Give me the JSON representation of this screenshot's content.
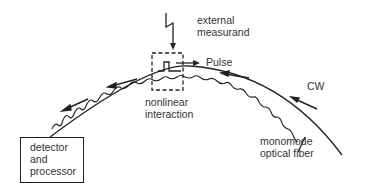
{
  "diagram": {
    "labels": {
      "external_measurand_line1": "external",
      "external_measurand_line2": "measurand",
      "pulse": "Pulse",
      "cw": "CW",
      "nonlinear_line1": "nonlinear",
      "nonlinear_line2": "interaction",
      "fiber_line1": "monomode",
      "fiber_line2": "optical fiber",
      "detector_line1": "detector",
      "detector_line2": "and",
      "detector_line3": "processor"
    },
    "elements": [
      {
        "id": "external-measurand-arrow",
        "icon": "lightning-arrow-icon"
      },
      {
        "id": "nonlinear-interaction-region",
        "style": "dashed-box"
      },
      {
        "id": "pulse-symbol",
        "icon": "square-pulse-icon"
      },
      {
        "id": "monomode-fiber",
        "style": "curved-line"
      },
      {
        "id": "cw-wave",
        "style": "wavy-line",
        "direction": "toward detector"
      },
      {
        "id": "detector-box",
        "style": "solid-box"
      }
    ],
    "colors": {
      "line": "#222222",
      "background": "#ffffff"
    }
  }
}
